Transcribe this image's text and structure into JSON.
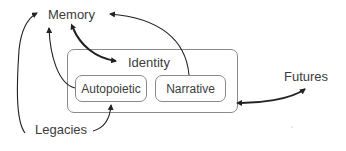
{
  "diagram": {
    "nodes": {
      "memory": {
        "label": "Memory"
      },
      "identity": {
        "label": "Identity"
      },
      "autopoietic": {
        "label": "Autopoietic"
      },
      "narrative": {
        "label": "Narrative"
      },
      "futures": {
        "label": "Futures"
      },
      "legacies": {
        "label": "Legacies"
      }
    },
    "edges": [
      {
        "from": "memory",
        "to": "identity",
        "style": "bidirectional"
      },
      {
        "from": "narrative",
        "to": "memory",
        "style": "directed"
      },
      {
        "from": "autopoietic",
        "to": "memory",
        "style": "directed"
      },
      {
        "from": "legacies",
        "to": "memory",
        "style": "directed"
      },
      {
        "from": "legacies",
        "to": "autopoietic",
        "style": "directed"
      },
      {
        "from": "futures",
        "to": "identity",
        "style": "bidirectional"
      }
    ],
    "colors": {
      "arrow": "#222222",
      "box_border": "#8a8a8a",
      "text": "#3c3c3c"
    }
  }
}
